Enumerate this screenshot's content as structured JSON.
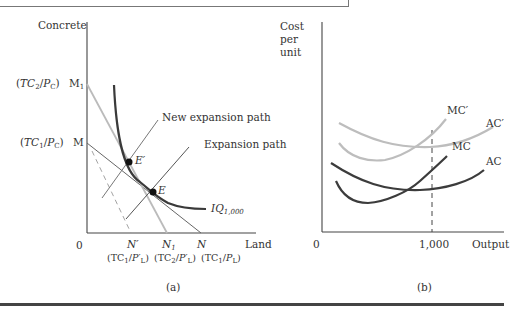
{
  "panel_a": {
    "caption": "(a)",
    "y_axis_label": "Concrete",
    "x_axis_label": "Land",
    "origin_label": "0",
    "y_ticks": [
      {
        "paren": "(TC2/PC)",
        "point": "M1"
      },
      {
        "paren": "(TC1/PC)",
        "point": "M"
      }
    ],
    "x_ticks": [
      {
        "point": "N′",
        "paren": "(TC1/P′L)"
      },
      {
        "point": "N1",
        "paren": "(TC2/P′L)"
      },
      {
        "point": "N",
        "paren": "(TC1/PL)"
      }
    ],
    "annotations": {
      "new_expansion_path": "New expansion path",
      "expansion_path": "Expansion path",
      "point_e": "E",
      "point_e_prime": "E′",
      "isoquant": "IQ1,000"
    },
    "colors": {
      "isoquant": "#3a3a3a",
      "budget_original": "#555555",
      "budget_new": "#b8b8b8",
      "expansion": "#555555"
    }
  },
  "panel_b": {
    "caption": "(b)",
    "y_axis_label": "Cost per unit",
    "x_axis_label": "Output",
    "origin_label": "0",
    "x_tick": "1,000",
    "curves": [
      "MC′",
      "AC′",
      "MC",
      "AC"
    ],
    "colors": {
      "new_curves": "#bdbdbd",
      "original_curves": "#3c3c3c"
    }
  }
}
